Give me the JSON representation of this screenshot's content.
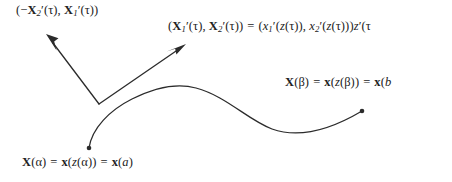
{
  "figure": {
    "background": "#ffffff",
    "stroke_color": "#222222",
    "width": 452,
    "height": 182
  },
  "labels": {
    "normal_vector": {
      "text": "(−X₂′(τ), X₁′(τ))",
      "parts": {
        "open": "(−",
        "X_first": "X",
        "sub_first": "2",
        "prime_first": "′(",
        "tau_first": "τ",
        "close_first": "), ",
        "X_second": "X",
        "sub_second": "1",
        "prime_second": "′(",
        "tau_second": "τ",
        "close": "))"
      }
    },
    "tangent_vector": {
      "text": "(X₁′(τ), X₂′(τ)) = (x₁′(z(τ)), x₂′(z(τ)))z′(τ",
      "clipped": true,
      "parts": {
        "open": "(",
        "X_one": "X",
        "sub_one": "1",
        "prime_one": "′(",
        "tau_one": "τ",
        "sep": "), ",
        "X_two": "X",
        "sub_two": "2",
        "prime_two": "′(",
        "tau_two": "τ",
        "close_lhs": "))",
        "equals": "=",
        "open_rhs": "(",
        "x_one": "x",
        "sub_x_one": "1",
        "prime_x_one": "′(",
        "z_one": "z",
        "ztau_one": "(τ)), ",
        "x_two": "x",
        "sub_x_two": "2",
        "prime_x_two": "′(",
        "z_two": "z",
        "ztau_two": "(τ)))",
        "z_final": "z",
        "z_final_tail": "′(τ"
      }
    },
    "endpoint_beta": {
      "text": "X(β) = x(z(β)) = x(b",
      "clipped": true,
      "parts": {
        "X": "X",
        "beta_arg": "(β)",
        "equals_one": "=",
        "x_bold": "x",
        "open": "(",
        "z": "z",
        "beta_inner": "(β))",
        "equals_two": "=",
        "x_bold_two": "x",
        "open_two": "(",
        "b": "b"
      }
    },
    "startpoint_alpha": {
      "text": "X(α) = x(z(α)) = x(a)",
      "clipped": false,
      "parts": {
        "X": "X",
        "alpha_arg": "(α)",
        "equals_one": "=",
        "x_bold": "x",
        "open": "(",
        "z": "z",
        "alpha_inner": "(α))",
        "equals_two": "=",
        "x_bold_two": "x",
        "open_two": "(",
        "a": "a",
        "close": ")"
      }
    }
  },
  "geometry": {
    "curve": {
      "name": "parametric-curve",
      "start_point": [
        89,
        148
      ],
      "end_point": [
        362,
        111
      ],
      "path": "M 89 148 C 92 128, 110 110, 132 99 C 158 86, 178 83, 196 88 C 226 96, 248 120, 272 129 C 300 139, 330 130, 362 111"
    },
    "start_dot": {
      "cx": 89,
      "cy": 148,
      "r": 2.4
    },
    "end_dot": {
      "cx": 362,
      "cy": 111,
      "r": 2.4
    },
    "base_point": [
      99,
      104
    ],
    "normal_arrow": {
      "name": "normal-arrow",
      "tail": [
        99,
        104
      ],
      "tip": [
        46,
        34
      ]
    },
    "tangent_arrow": {
      "name": "tangent-arrow",
      "tail": [
        99,
        104
      ],
      "tip": [
        186,
        44
      ]
    }
  }
}
